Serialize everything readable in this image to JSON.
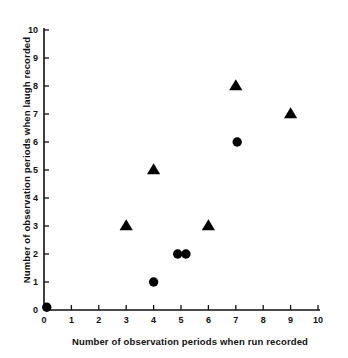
{
  "chart_data": {
    "type": "scatter",
    "title": "",
    "xlabel": "Number of observation periods when  run recorded",
    "ylabel": "Number of observation periods when laugh recorded",
    "xlim": [
      0,
      10
    ],
    "ylim": [
      0,
      10
    ],
    "xticks": [
      0,
      1,
      2,
      3,
      4,
      5,
      6,
      7,
      8,
      9,
      10
    ],
    "yticks": [
      0,
      1,
      2,
      3,
      4,
      5,
      6,
      7,
      8,
      9,
      10
    ],
    "xtick_labels": [
      "0",
      "1",
      "2",
      "3",
      "4",
      "5",
      "6",
      "7",
      "8",
      "9",
      "10"
    ],
    "ytick_labels": [
      "0",
      "1",
      "2",
      "3",
      "4",
      "5",
      "6",
      "7",
      "8",
      "9",
      "10"
    ],
    "grid": false,
    "legend": false,
    "legend_position": "none",
    "marker_color": "#000000",
    "axis_color": "#111111",
    "series": [
      {
        "name": "triangle-markers",
        "marker": "triangle",
        "points": [
          {
            "x": 3,
            "y": 3
          },
          {
            "x": 4,
            "y": 5
          },
          {
            "x": 6,
            "y": 3
          },
          {
            "x": 7,
            "y": 8
          },
          {
            "x": 9,
            "y": 7
          }
        ]
      },
      {
        "name": "circle-markers",
        "marker": "circle",
        "points": [
          {
            "x": 0.1,
            "y": 0.1
          },
          {
            "x": 4,
            "y": 1
          },
          {
            "x": 4.88,
            "y": 2
          },
          {
            "x": 5.18,
            "y": 2
          },
          {
            "x": 7.05,
            "y": 6
          }
        ]
      }
    ]
  },
  "axes": {
    "x_title": "Number of observation periods when  run recorded",
    "y_title": "Number of observation periods when laugh recorded"
  }
}
